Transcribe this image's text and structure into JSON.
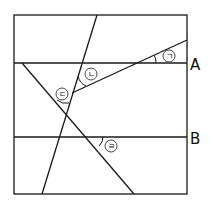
{
  "diagram": {
    "type": "geometry-parallel-lines",
    "line_labels": {
      "A": "A",
      "B": "B"
    },
    "angle_labels": {
      "a1": "ㄱ",
      "a2": "ㄴ",
      "a3": "ㄷ",
      "a4": "ㄹ"
    }
  }
}
